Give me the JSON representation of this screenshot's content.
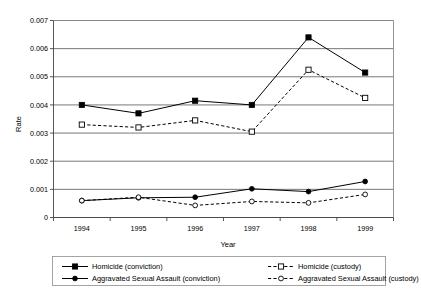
{
  "chart_data": {
    "type": "line",
    "title": "",
    "xlabel": "Year",
    "ylabel": "Rate",
    "categories": [
      "1994",
      "1995",
      "1996",
      "1997",
      "1998",
      "1999"
    ],
    "x": [
      1994,
      1995,
      1996,
      1997,
      1998,
      1999
    ],
    "ylim": [
      0,
      0.007
    ],
    "yticks": [
      0,
      0.001,
      0.002,
      0.003,
      0.004,
      0.005,
      0.006,
      0.007
    ],
    "ytick_labels": [
      "0",
      "0.001",
      "0.002",
      "0.003",
      "0.004",
      "0.005",
      "0.006",
      "0.007"
    ],
    "grid": "horizontal",
    "legend_position": "bottom",
    "series": [
      {
        "name": "Homicide (conviction)",
        "marker": "filled-square",
        "line": "solid",
        "color": "#000000",
        "values": [
          0.004,
          0.0037,
          0.00415,
          0.004,
          0.0064,
          0.00515
        ]
      },
      {
        "name": "Homicide (custody)",
        "marker": "open-square",
        "line": "dashed",
        "color": "#000000",
        "values": [
          0.0033,
          0.0032,
          0.00345,
          0.00305,
          0.00525,
          0.00425
        ]
      },
      {
        "name": "Aggravated Sexual Assault (conviction)",
        "marker": "filled-circle",
        "line": "solid",
        "color": "#000000",
        "values": [
          0.0006,
          0.0007,
          0.00072,
          0.00102,
          0.00092,
          0.00128
        ]
      },
      {
        "name": "Aggravated Sexual Assault (custody)",
        "marker": "open-circle",
        "line": "dashed",
        "color": "#000000",
        "values": [
          0.0006,
          0.00072,
          0.00043,
          0.00057,
          0.00052,
          0.00082
        ]
      }
    ]
  },
  "legend": {
    "entries": [
      {
        "label": "Homicide (conviction)",
        "marker": "filled-square",
        "line": "solid"
      },
      {
        "label": "Homicide (custody)",
        "marker": "open-square",
        "line": "dashed"
      },
      {
        "label": "Aggravated Sexual Assault (conviction)",
        "marker": "filled-circle",
        "line": "solid"
      },
      {
        "label": "Aggravated Sexual Assault (custody)",
        "marker": "open-circle",
        "line": "dashed"
      }
    ]
  }
}
